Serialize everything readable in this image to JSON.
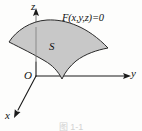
{
  "figure": {
    "title_label": "F(x,y,z)=0",
    "surface_label": "S",
    "origin_label": "O",
    "caption": "图 1-1",
    "axes": [
      {
        "name": "z",
        "label": "z",
        "direction": "up"
      },
      {
        "name": "y",
        "label": "y",
        "direction": "right"
      },
      {
        "name": "x",
        "label": "x",
        "direction": "down-left"
      }
    ],
    "colors": {
      "surface_fill": "#c8c8c8",
      "surface_stroke": "#2a2a2a",
      "axis_stroke": "#1a1a1a",
      "hidden_axis_stroke": "#7c7c7c",
      "text": "#111111",
      "background": "#fdfdfc",
      "caption_text": "#d2d2d2"
    }
  }
}
